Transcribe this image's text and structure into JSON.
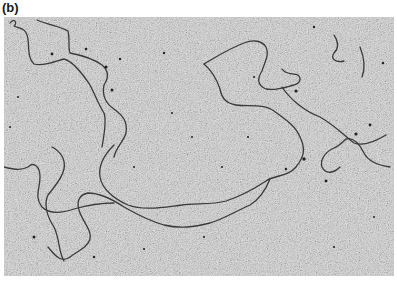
{
  "figure": {
    "panel_label": "(b)",
    "background_color": "#b9b9b9",
    "strand_color": "#3a3a3a"
  }
}
